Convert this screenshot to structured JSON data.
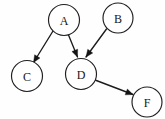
{
  "figure": {
    "kind": "directed-graph",
    "background_color": "#fefefe",
    "stroke_color": "#1b1b1b",
    "node_fill_color": "#ffffff",
    "node_label_color": "#161616",
    "width": 165,
    "height": 119
  },
  "nodes": [
    {
      "id": "A",
      "label": "A",
      "cx": 64,
      "cy": 20,
      "r": 15.5
    },
    {
      "id": "B",
      "label": "B",
      "cx": 118,
      "cy": 18,
      "r": 15.0
    },
    {
      "id": "C",
      "label": "C",
      "cx": 27,
      "cy": 76,
      "r": 15.5
    },
    {
      "id": "D",
      "label": "D",
      "cx": 81,
      "cy": 74,
      "r": 15.5
    },
    {
      "id": "F",
      "label": "F",
      "cx": 147,
      "cy": 102,
      "r": 15.0
    }
  ],
  "edges": [
    {
      "id": "A-C",
      "from": "A",
      "to": "C",
      "directed": true,
      "x1": 53.0,
      "y1": 31.0,
      "x2": 33.5,
      "y2": 62.5,
      "head_angle_deg": 238
    },
    {
      "id": "A-D",
      "from": "A",
      "to": "D",
      "directed": true,
      "x1": 68.5,
      "y1": 35.0,
      "x2": 77.5,
      "y2": 57.0,
      "head_angle_deg": 292
    },
    {
      "id": "B-D",
      "from": "B",
      "to": "D",
      "directed": true,
      "x1": 106.5,
      "y1": 29.0,
      "x2": 86.0,
      "y2": 57.0,
      "head_angle_deg": 306
    },
    {
      "id": "D-F",
      "from": "D",
      "to": "F",
      "directed": true,
      "x1": 95.0,
      "y1": 80.0,
      "x2": 133.0,
      "y2": 94.5,
      "head_angle_deg": 21
    }
  ]
}
